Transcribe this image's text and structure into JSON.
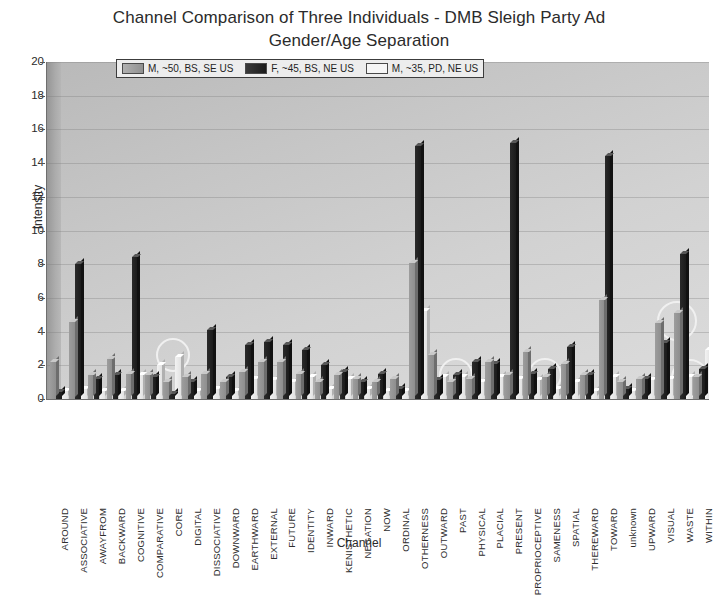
{
  "chart_data": {
    "type": "bar",
    "title": "Channel Comparison of Three Individuals - DMB Sleigh Party Ad Gender/Age Separation",
    "title_line1": "Channel Comparison of Three Individuals - DMB Sleigh Party Ad",
    "title_line2": "Gender/Age Separation",
    "xlabel": "Channel",
    "ylabel": "Intensity",
    "ylim": [
      0,
      20
    ],
    "yticks": [
      0,
      2,
      4,
      6,
      8,
      10,
      12,
      14,
      16,
      18,
      20
    ],
    "grid": true,
    "legend_position": "top-center",
    "categories": [
      "AROUND",
      "ASSOCIATIVE",
      "AWAYFROM",
      "BACKWARD",
      "COGNITIVE",
      "COMPARATIVE",
      "CORE",
      "DIGITAL",
      "DISSOCIATIVE",
      "DOWNWARD",
      "EARTHWARD",
      "EXTERNAL",
      "FUTURE",
      "IDENTITY",
      "INWARD",
      "KENISTHETIC",
      "NEGATION",
      "NOW",
      "ORDINAL",
      "OTHERNESS",
      "OUTWARD",
      "PAST",
      "PHYSICAL",
      "PLACIAL",
      "PRESENT",
      "PROPRIOCEPTIVE",
      "SAMENESS",
      "SPATIAL",
      "THEREWARD",
      "TOWARD",
      "unknown",
      "UPWARD",
      "VISUAL",
      "WASTE",
      "WITHIN"
    ],
    "series": [
      {
        "name": "M, ~50, BS, SE US",
        "color": "#9d9d9d",
        "values": [
          2.2,
          4.6,
          1.4,
          2.4,
          1.5,
          1.4,
          1.0,
          1.3,
          1.5,
          1.0,
          1.6,
          2.2,
          2.2,
          1.5,
          1.0,
          1.4,
          1.2,
          1.0,
          1.2,
          8.1,
          2.6,
          1.0,
          1.2,
          2.2,
          1.4,
          2.8,
          1.3,
          2.1,
          1.4,
          5.9,
          1.0,
          1.2,
          4.5,
          5.1,
          1.3
        ]
      },
      {
        "name": "F, ~45, BS, NE US",
        "color": "#1f1f1f",
        "values": [
          0.4,
          8.0,
          1.2,
          1.4,
          8.4,
          1.3,
          0.3,
          1.0,
          4.1,
          1.3,
          3.2,
          3.4,
          3.2,
          2.9,
          2.0,
          1.6,
          1.0,
          1.5,
          0.6,
          15.0,
          1.1,
          1.4,
          2.2,
          2.1,
          15.2,
          1.5,
          1.8,
          3.1,
          1.4,
          14.4,
          0.6,
          1.2,
          3.3,
          8.6,
          1.8
        ]
      },
      {
        "name": "M, ~35, PD, NE US",
        "color": "#f0f0f0",
        "values": [
          0.5,
          0.6,
          0.5,
          0.5,
          1.4,
          2.0,
          2.5,
          0.5,
          0.6,
          0.5,
          1.2,
          1.1,
          1.0,
          1.3,
          0.6,
          1.2,
          0.6,
          0.5,
          0.5,
          5.2,
          1.3,
          1.3,
          1.0,
          1.3,
          1.2,
          1.1,
          0.6,
          1.0,
          0.5,
          1.3,
          0.5,
          1.1,
          1.2,
          1.3,
          2.9
        ]
      }
    ],
    "annotations": [
      {
        "label": "circle-core",
        "cx": 173,
        "cy": 355,
        "r": 17
      },
      {
        "label": "circle-past",
        "cx": 456,
        "cy": 375,
        "r": 17
      },
      {
        "label": "circle-proprioceptive",
        "cx": 545,
        "cy": 375,
        "r": 17
      },
      {
        "label": "circle-waste-upper",
        "cx": 677,
        "cy": 321,
        "r": 20
      },
      {
        "label": "circle-waste-lower",
        "cx": 690,
        "cy": 378,
        "r": 19
      }
    ]
  },
  "legend": {
    "items": [
      {
        "label": "M, ~50, BS, SE US",
        "swatch": "k0"
      },
      {
        "label": "F, ~45, BS, NE US",
        "swatch": "k1"
      },
      {
        "label": "M, ~35, PD, NE US",
        "swatch": "k2"
      }
    ]
  }
}
